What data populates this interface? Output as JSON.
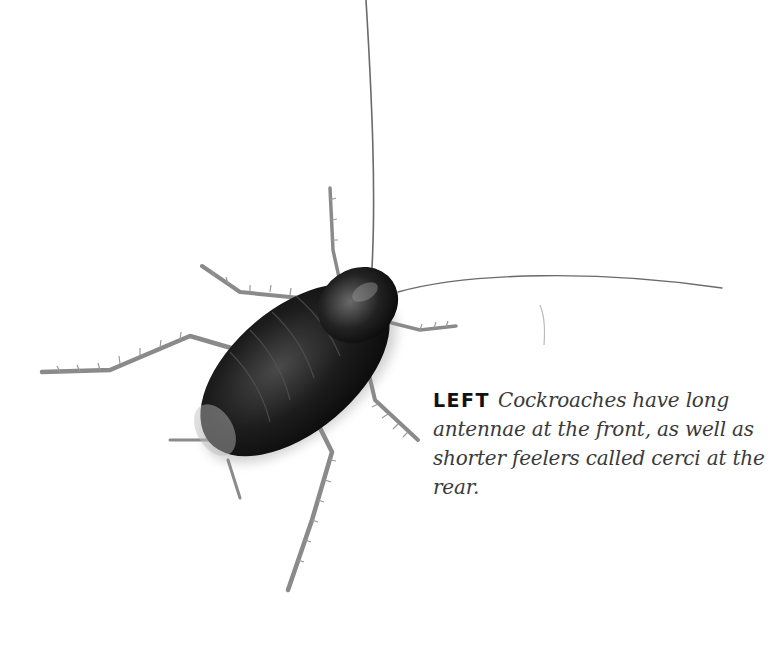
{
  "figure": {
    "subject": "cockroach",
    "caption": {
      "label": "LEFT",
      "text": "Cockroaches have long antennae at the front, as well as shorter feelers called cerci at the rear."
    },
    "colors": {
      "background": "#ffffff",
      "body": "#1a1a1a",
      "legs": "#8a8a8a",
      "caption_text": "#3a3a3a"
    }
  }
}
